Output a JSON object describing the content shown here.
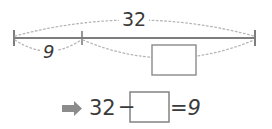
{
  "diagram": {
    "type": "bar-model-number-line",
    "whole_label": "32",
    "known_part_label": "9",
    "unknown_part_label": "",
    "unknown_part_placeholder_name": "empty-answer-box",
    "ticks": [
      {
        "name": "left-endpoint",
        "x": 14
      },
      {
        "name": "middle-divider",
        "x": 82
      },
      {
        "name": "right-endpoint",
        "x": 255
      }
    ],
    "arcs": [
      {
        "name": "total-arc",
        "from": "left-endpoint",
        "to": "right-endpoint",
        "label": "32",
        "direction": "above"
      },
      {
        "name": "part-arc",
        "from": "left-endpoint",
        "to": "middle-divider",
        "label": "9",
        "direction": "below"
      },
      {
        "name": "unknown-arc",
        "from": "middle-divider",
        "to": "right-endpoint",
        "label": "",
        "direction": "below"
      }
    ]
  },
  "equation": {
    "bullet_icon": "right-arrow-icon",
    "minuend": "32",
    "operator": "−",
    "blank": "",
    "equals": "=",
    "result": "9",
    "full_text": "32 − □ = 9"
  },
  "colors": {
    "line": "#7d7d7d",
    "dotted": "#b0b0b0",
    "text": "#3a3a3a",
    "box_border": "#8a8a8a",
    "arrow": "#8c8c8c",
    "background": "#ffffff"
  }
}
